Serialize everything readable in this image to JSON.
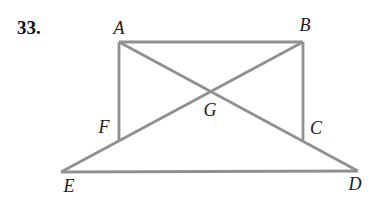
{
  "problem_number": "33.",
  "figure": {
    "line_color": "#909090",
    "line_width": 2.8,
    "label_color": "#1a1a1a",
    "points": {
      "A": {
        "label": "A",
        "x": 119,
        "y": 42,
        "lx": 119,
        "ly": 28
      },
      "B": {
        "label": "B",
        "x": 303,
        "y": 42,
        "lx": 305,
        "ly": 25
      },
      "C": {
        "label": "C",
        "x": 303,
        "y": 140,
        "lx": 316,
        "ly": 128
      },
      "D": {
        "label": "D",
        "x": 358,
        "y": 171,
        "lx": 355,
        "ly": 184
      },
      "E": {
        "label": "E",
        "x": 61,
        "y": 172,
        "lx": 69,
        "ly": 186
      },
      "F": {
        "label": "F",
        "x": 119,
        "y": 140,
        "lx": 104,
        "ly": 127
      },
      "G": {
        "label": "G",
        "x": 211,
        "y": 91,
        "lx": 210,
        "ly": 110
      }
    },
    "segments": [
      [
        "A",
        "B"
      ],
      [
        "A",
        "F"
      ],
      [
        "B",
        "C"
      ],
      [
        "E",
        "D"
      ],
      [
        "E",
        "B"
      ],
      [
        "A",
        "D"
      ]
    ]
  }
}
